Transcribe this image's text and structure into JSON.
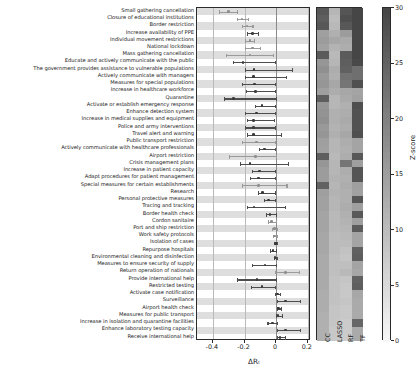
{
  "chart_data": {
    "type": "forest_plus_heatmap",
    "title": "",
    "xlabel": "ΔRₜ",
    "xlim": [
      -0.5,
      0.22
    ],
    "xticks": [
      -0.4,
      -0.2,
      0,
      0.2
    ],
    "xticklabels": [
      "-0.4",
      "-0.2",
      "0",
      "0.2"
    ],
    "grid": true,
    "zero_reference_line": 0,
    "heatmap": {
      "columns": [
        "CC",
        "LASSO",
        "RF",
        "TF"
      ],
      "colorbar_label": "Z-score",
      "colorbar_range": [
        0,
        30
      ],
      "colorbar_ticks": [
        0,
        5,
        10,
        15,
        20,
        25,
        30
      ],
      "colormap": "gray_reversed"
    },
    "categories": [
      "Small gathering cancellation",
      "Closure of educational institutions",
      "Border restriction",
      "Increase availability of PPE",
      "Individual movement restrictions",
      "National lockdown",
      "Mass gathering cancellation",
      "Educate and actively communicate with the public",
      "The government provides assistance to vulnerable populations",
      "Actively communicate with managers",
      "Measures for special populations",
      "Increase in healthcare workforce",
      "Quarantine",
      "Activate or establish emergency response",
      "Enhance detection system",
      "Increase in medical supplies and equipment",
      "Police and army interventions",
      "Travel alert and warning",
      "Public transport restriction",
      "Actively communicate with healthcare professionals",
      "Airport restriction",
      "Crisis management plans",
      "Increase in patient capacity",
      "Adapt procedures for patient management",
      "Special measures for certain establishments",
      "Research",
      "Personal protective measures",
      "Tracing and tracking",
      "Border health check",
      "Cordon sanitaire",
      "Port and ship restriction",
      "Work safety protocols",
      "Isolation of cases",
      "Repurpose hospitals",
      "Environmental cleaning and disinfection",
      "Measures to ensure security of supply",
      "Return operation of nationals",
      "Provide international help",
      "Restricted testing",
      "Activate case notification",
      "Surveillance",
      "Airport health check",
      "Measures for public transport",
      "Increase in isolation and quarantine facilities",
      "Enhance laboratory testing capacity",
      "Receive international help"
    ],
    "effects": [
      {
        "mean": -0.3,
        "low": -0.36,
        "high": -0.25,
        "faint": true
      },
      {
        "mean": -0.215,
        "low": -0.25,
        "high": -0.18,
        "faint": true
      },
      {
        "mean": -0.185,
        "low": -0.215,
        "high": -0.15,
        "faint": true
      },
      {
        "mean": -0.15,
        "low": -0.185,
        "high": -0.115,
        "faint": false
      },
      {
        "mean": -0.165,
        "low": -0.195,
        "high": -0.14,
        "faint": true
      },
      {
        "mean": -0.15,
        "low": -0.195,
        "high": -0.105,
        "faint": true
      },
      {
        "mean": -0.165,
        "low": -0.32,
        "high": -0.02,
        "faint": true
      },
      {
        "mean": -0.21,
        "low": -0.275,
        "high": -0.005,
        "faint": false
      },
      {
        "mean": -0.14,
        "low": -0.2,
        "high": 0.1,
        "faint": false
      },
      {
        "mean": -0.145,
        "low": -0.195,
        "high": 0.06,
        "faint": false
      },
      {
        "mean": -0.135,
        "low": -0.215,
        "high": -0.01,
        "faint": false
      },
      {
        "mean": -0.13,
        "low": -0.19,
        "high": -0.005,
        "faint": false
      },
      {
        "mean": -0.27,
        "low": -0.33,
        "high": 0.0,
        "faint": false
      },
      {
        "mean": -0.09,
        "low": -0.135,
        "high": -0.005,
        "faint": false
      },
      {
        "mean": -0.125,
        "low": -0.2,
        "high": -0.005,
        "faint": false
      },
      {
        "mean": -0.145,
        "low": -0.185,
        "high": -0.015,
        "faint": false
      },
      {
        "mean": -0.145,
        "low": -0.2,
        "high": -0.01,
        "faint": false
      },
      {
        "mean": -0.145,
        "low": -0.185,
        "high": 0.03,
        "faint": false
      },
      {
        "mean": -0.125,
        "low": -0.215,
        "high": -0.005,
        "faint": true
      },
      {
        "mean": -0.075,
        "low": -0.11,
        "high": -0.005,
        "faint": false
      },
      {
        "mean": -0.13,
        "low": -0.3,
        "high": 0.0,
        "faint": true
      },
      {
        "mean": -0.165,
        "low": -0.23,
        "high": 0.075,
        "faint": false
      },
      {
        "mean": -0.105,
        "low": -0.155,
        "high": -0.005,
        "faint": false
      },
      {
        "mean": -0.11,
        "low": -0.165,
        "high": -0.005,
        "faint": false
      },
      {
        "mean": -0.11,
        "low": -0.215,
        "high": 0.065,
        "faint": true
      },
      {
        "mean": -0.085,
        "low": -0.115,
        "high": -0.005,
        "faint": false
      },
      {
        "mean": -0.05,
        "low": -0.075,
        "high": -0.005,
        "faint": false
      },
      {
        "mean": -0.14,
        "low": -0.185,
        "high": 0.055,
        "faint": false
      },
      {
        "mean": -0.04,
        "low": -0.065,
        "high": -0.003,
        "faint": false
      },
      {
        "mean": -0.03,
        "low": -0.05,
        "high": 0.0,
        "faint": true
      },
      {
        "mean": -0.012,
        "low": -0.025,
        "high": 0.005,
        "faint": true
      },
      {
        "mean": -0.01,
        "low": -0.02,
        "high": 0.002,
        "faint": true
      },
      {
        "mean": -0.006,
        "low": -0.012,
        "high": 0.002,
        "faint": false
      },
      {
        "mean": -0.02,
        "low": -0.038,
        "high": -0.002,
        "faint": false
      },
      {
        "mean": -0.007,
        "low": -0.015,
        "high": 0.002,
        "faint": false
      },
      {
        "mean": -0.07,
        "low": -0.155,
        "high": 0.0,
        "faint": false
      },
      {
        "mean": 0.06,
        "low": -0.01,
        "high": 0.145,
        "faint": true
      },
      {
        "mean": -0.12,
        "low": -0.25,
        "high": 0.0,
        "faint": false
      },
      {
        "mean": -0.09,
        "low": -0.16,
        "high": -0.005,
        "faint": false
      },
      {
        "mean": 0.008,
        "low": -0.005,
        "high": 0.022,
        "faint": false
      },
      {
        "mean": 0.06,
        "low": 0.005,
        "high": 0.15,
        "faint": false
      },
      {
        "mean": 0.016,
        "low": 0.004,
        "high": 0.03,
        "faint": false
      },
      {
        "mean": 0.012,
        "low": 0.0,
        "high": 0.035,
        "faint": false
      },
      {
        "mean": -0.025,
        "low": -0.055,
        "high": 0.003,
        "faint": false
      },
      {
        "mean": 0.06,
        "low": 0.005,
        "high": 0.15,
        "faint": false
      },
      {
        "mean": 0.025,
        "low": 0.003,
        "high": 0.055,
        "faint": false
      }
    ],
    "heatmap_values": [
      [
        27.0,
        11.0,
        27.5,
        30.0
      ],
      [
        26.0,
        10.0,
        28.5,
        30.0
      ],
      [
        27.0,
        10.5,
        27.0,
        30.0
      ],
      [
        15.0,
        12.0,
        15.5,
        30.0
      ],
      [
        15.5,
        13.5,
        13.0,
        30.0
      ],
      [
        14.5,
        11.5,
        12.5,
        30.0
      ],
      [
        26.5,
        10.5,
        26.5,
        30.0
      ],
      [
        16.5,
        11.0,
        26.0,
        29.5
      ],
      [
        17.5,
        12.5,
        25.5,
        23.0
      ],
      [
        16.0,
        12.0,
        22.5,
        23.0
      ],
      [
        16.5,
        13.5,
        22.0,
        28.5
      ],
      [
        15.0,
        12.5,
        13.5,
        14.0
      ],
      [
        26.0,
        11.0,
        13.0,
        14.5
      ],
      [
        16.5,
        11.0,
        12.0,
        28.5
      ],
      [
        17.0,
        12.0,
        12.5,
        28.0
      ],
      [
        17.5,
        12.0,
        13.0,
        28.0
      ],
      [
        16.0,
        11.5,
        12.5,
        28.0
      ],
      [
        16.5,
        12.0,
        13.5,
        28.5
      ],
      [
        15.0,
        11.0,
        12.5,
        14.0
      ],
      [
        14.5,
        11.0,
        12.0,
        14.0
      ],
      [
        26.0,
        10.5,
        12.5,
        27.0
      ],
      [
        16.5,
        11.0,
        22.0,
        15.0
      ],
      [
        15.5,
        11.0,
        12.5,
        27.5
      ],
      [
        15.5,
        11.5,
        12.0,
        27.5
      ],
      [
        25.5,
        11.0,
        12.5,
        15.0
      ],
      [
        15.0,
        11.5,
        12.0,
        14.5
      ],
      [
        14.5,
        11.0,
        12.0,
        27.5
      ],
      [
        14.5,
        11.0,
        12.5,
        15.0
      ],
      [
        14.0,
        10.5,
        12.0,
        27.0
      ],
      [
        14.0,
        10.5,
        11.5,
        15.0
      ],
      [
        14.0,
        10.5,
        11.0,
        26.5
      ],
      [
        13.5,
        10.0,
        10.5,
        14.0
      ],
      [
        13.5,
        10.0,
        10.0,
        14.0
      ],
      [
        13.5,
        10.0,
        9.0,
        25.5
      ],
      [
        13.0,
        9.5,
        8.5,
        26.0
      ],
      [
        13.0,
        9.5,
        9.5,
        14.0
      ],
      [
        13.0,
        9.5,
        10.5,
        13.5
      ],
      [
        13.0,
        9.0,
        8.5,
        25.5
      ],
      [
        13.0,
        9.0,
        8.0,
        26.0
      ],
      [
        12.5,
        9.0,
        8.0,
        13.5
      ],
      [
        12.5,
        9.0,
        8.5,
        13.0
      ],
      [
        12.5,
        8.5,
        8.0,
        13.0
      ],
      [
        12.0,
        8.5,
        8.0,
        13.0
      ],
      [
        12.0,
        8.5,
        7.5,
        24.5
      ],
      [
        12.0,
        8.0,
        7.5,
        13.0
      ],
      [
        12.0,
        8.0,
        7.5,
        13.0
      ]
    ]
  }
}
